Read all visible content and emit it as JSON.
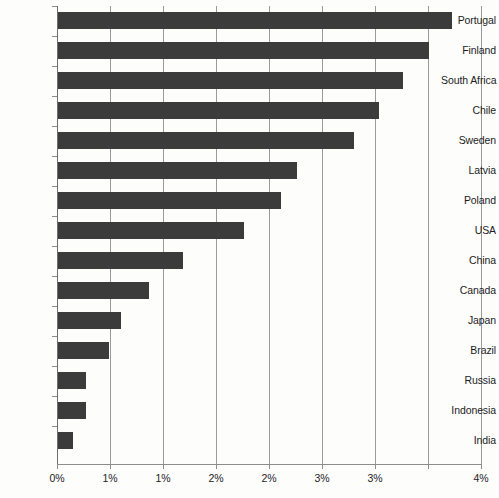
{
  "chart_data": {
    "type": "bar",
    "orientation": "horizontal",
    "title": "",
    "subtitle": "",
    "xlabel": "",
    "ylabel": "",
    "categories": [
      "Portugal",
      "Finland",
      "South Africa",
      "Chile",
      "Sweden",
      "Latvia",
      "Poland",
      "USA",
      "China",
      "Canada",
      "Japan",
      "Brazil",
      "Russia",
      "Indonesia",
      "India"
    ],
    "values": [
      3.72,
      3.5,
      3.25,
      3.03,
      2.79,
      2.25,
      2.1,
      1.75,
      1.18,
      0.86,
      0.59,
      0.48,
      0.26,
      0.26,
      0.14
    ],
    "value_unit": "%",
    "xlim": [
      0,
      4
    ],
    "xticks": [
      0,
      0.5,
      1,
      1.5,
      2,
      2.5,
      3,
      3.5,
      4
    ],
    "xtick_labels": [
      "0%",
      "1%",
      "1%",
      "2%",
      "2%",
      "3%",
      "3%",
      "4%"
    ],
    "xtick_labels_full": [
      "0%",
      "1%",
      "1%",
      "2%",
      "2%",
      "3%",
      "3%",
      "4%"
    ],
    "grid": "vertical",
    "legend": "none",
    "bar_color": "#3b3b3b",
    "background_color": "#fdfdfc",
    "axis_color": "#8d8d8d",
    "grid_color": "#9a9a9a"
  },
  "ticks": [
    {
      "label": "0%",
      "value": 0
    },
    {
      "label": "1%",
      "value": 0.5
    },
    {
      "label": "1%",
      "value": 1
    },
    {
      "label": "2%",
      "value": 1.5
    },
    {
      "label": "2%",
      "value": 2
    },
    {
      "label": "3%",
      "value": 2.5
    },
    {
      "label": "3%",
      "value": 3
    },
    {
      "label": "4%",
      "value": 4
    }
  ],
  "bars": [
    {
      "label": "Portugal",
      "value": 3.72
    },
    {
      "label": "Finland",
      "value": 3.5
    },
    {
      "label": "South Africa",
      "value": 3.25
    },
    {
      "label": "Chile",
      "value": 3.03
    },
    {
      "label": "Sweden",
      "value": 2.79
    },
    {
      "label": "Latvia",
      "value": 2.25
    },
    {
      "label": "Poland",
      "value": 2.1
    },
    {
      "label": "USA",
      "value": 1.75
    },
    {
      "label": "China",
      "value": 1.18
    },
    {
      "label": "Canada",
      "value": 0.86
    },
    {
      "label": "Japan",
      "value": 0.59
    },
    {
      "label": "Brazil",
      "value": 0.48
    },
    {
      "label": "Russia",
      "value": 0.26
    },
    {
      "label": "Indonesia",
      "value": 0.26
    },
    {
      "label": "India",
      "value": 0.14
    }
  ]
}
